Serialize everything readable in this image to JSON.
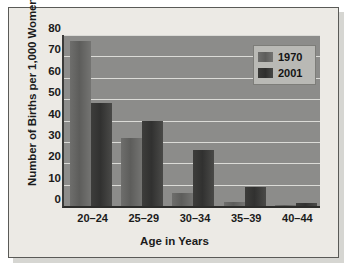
{
  "chart_data": {
    "type": "bar",
    "title": "",
    "xlabel": "Age in Years",
    "ylabel": "Number of Births per 1,000 Women",
    "categories": [
      "20–24",
      "25–29",
      "30–34",
      "35–39",
      "40–44"
    ],
    "series": [
      {
        "name": "1970",
        "values": [
          77,
          32,
          6,
          2,
          0.3
        ],
        "color": "#5d5d5b"
      },
      {
        "name": "2001",
        "values": [
          48,
          40,
          26,
          9,
          1.5
        ],
        "color": "#313130"
      }
    ],
    "ylim": [
      0,
      80
    ],
    "ytick_labels": [
      "80",
      "70",
      "60",
      "50",
      "40",
      "30",
      "20",
      "10",
      "0"
    ],
    "ytick_values": [
      80,
      70,
      60,
      50,
      40,
      30,
      20,
      10,
      0
    ],
    "grid": true,
    "legend_position": "top-right",
    "legend_entries": [
      "1970",
      "2001"
    ],
    "plot_background": "#8c8c8a",
    "gridline_color": "#e9e9e4",
    "card_background": "#eceae5"
  }
}
